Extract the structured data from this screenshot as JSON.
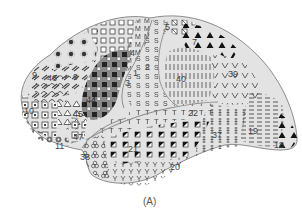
{
  "figure": {
    "caption": "(A)",
    "colors": {
      "outline": "#8c8c8c",
      "fill_light": "#e3e3e3",
      "fill_mid": "#d6d6d6",
      "broca": "#8a8a8a",
      "marker": "#333333",
      "label": "#444444"
    },
    "areas": [
      {
        "id": "1",
        "label": "1",
        "marker": "S"
      },
      {
        "id": "2",
        "label": "2",
        "marker": "S"
      },
      {
        "id": "3",
        "label": "3",
        "marker": "S"
      },
      {
        "id": "4",
        "label": "4",
        "marker": "M"
      },
      {
        "id": "5",
        "label": "5",
        "marker": "boxed-x"
      },
      {
        "id": "6",
        "label": "6",
        "marker": "open-square"
      },
      {
        "id": "7",
        "label": "7",
        "marker": "filled-triangle"
      },
      {
        "id": "8",
        "label": "8",
        "marker": "star-dot"
      },
      {
        "id": "9",
        "label": "9",
        "marker": "slash-dash"
      },
      {
        "id": "10",
        "label": "10",
        "marker": "boxed-square"
      },
      {
        "id": "11",
        "label": "11",
        "marker": "circle-dot"
      },
      {
        "id": "17",
        "label": "17",
        "marker": "none"
      },
      {
        "id": "18",
        "label": "18",
        "marker": "filled-triangle"
      },
      {
        "id": "19",
        "label": "19",
        "marker": "dash"
      },
      {
        "id": "20",
        "label": "20",
        "marker": "y"
      },
      {
        "id": "21",
        "label": "21",
        "marker": "half-filled-square"
      },
      {
        "id": "22",
        "label": "22",
        "marker": "T"
      },
      {
        "id": "37",
        "label": "37",
        "marker": "double-bar"
      },
      {
        "id": "38",
        "label": "38",
        "marker": "trefoil"
      },
      {
        "id": "39",
        "label": "39",
        "marker": "V"
      },
      {
        "id": "40",
        "label": "40",
        "marker": "vertical-bar"
      },
      {
        "id": "44",
        "label": "44",
        "marker": "filled-square"
      },
      {
        "id": "45",
        "label": "45",
        "marker": "open-triangle"
      },
      {
        "id": "46",
        "label": "46",
        "marker": "arc"
      },
      {
        "id": "47",
        "label": "47",
        "marker": "boxed-square"
      }
    ],
    "labels": {
      "a9": "9",
      "a46": "46",
      "a9b": "9",
      "a10": "10",
      "a44": "44",
      "a45": "45",
      "a47": "47",
      "a11": "11",
      "a38": "38",
      "a21": "21",
      "a20": "20",
      "a22": "22",
      "a37": "37",
      "a19": "19",
      "a18": "18",
      "a40": "40",
      "a39": "39",
      "a7": "7",
      "a5": "5",
      "a4": "4",
      "a3": "3",
      "a1": "1",
      "a2": "2",
      "a6": "6",
      "a8": "8"
    }
  }
}
